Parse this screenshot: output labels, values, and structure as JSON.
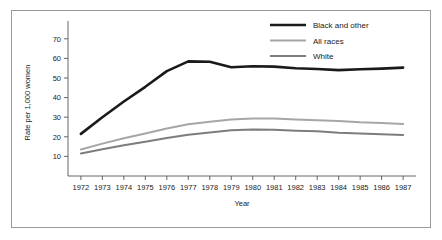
{
  "chart_data": {
    "type": "line",
    "title": "",
    "xlabel": "Year",
    "ylabel": "Rate per 1,000 women",
    "x": [
      1972,
      1973,
      1974,
      1975,
      1976,
      1977,
      1978,
      1979,
      1980,
      1981,
      1982,
      1983,
      1984,
      1985,
      1986,
      1987
    ],
    "xtick_labels": [
      "1972",
      "1973",
      "1974",
      "1975",
      "1976",
      "1977",
      "1978",
      "1979",
      "1980",
      "1981",
      "1982",
      "1983",
      "1984",
      "1985",
      "1986",
      "1987"
    ],
    "ytick_labels": [
      "10",
      "20",
      "30",
      "40",
      "50",
      "60",
      "70"
    ],
    "yticks": [
      10,
      20,
      30,
      40,
      50,
      60,
      70
    ],
    "xlim": [
      1971.4,
      1987.6
    ],
    "ylim": [
      0,
      75
    ],
    "grid": false,
    "legend_position": "top-right",
    "series": [
      {
        "name": "Black and other",
        "color": "#1a1a1a",
        "width": 2.6,
        "values": [
          21.5,
          30.0,
          38.0,
          45.5,
          53.5,
          58.5,
          58.3,
          55.5,
          56.0,
          55.8,
          55.0,
          54.6,
          54.0,
          54.5,
          54.8,
          55.3
        ]
      },
      {
        "name": "All races",
        "color": "#a6a6a6",
        "width": 2.0,
        "values": [
          13.5,
          16.5,
          19.3,
          21.7,
          24.2,
          26.4,
          27.7,
          28.8,
          29.3,
          29.3,
          28.8,
          28.5,
          28.1,
          27.4,
          27.0,
          26.5
        ]
      },
      {
        "name": "White",
        "color": "#7d7d7d",
        "width": 2.0,
        "values": [
          11.5,
          13.6,
          15.7,
          17.5,
          19.4,
          21.0,
          22.2,
          23.3,
          23.7,
          23.6,
          23.1,
          22.8,
          22.1,
          21.7,
          21.3,
          20.9
        ]
      }
    ]
  },
  "figure": {
    "border_color": "#9a9a9a",
    "background": "#ffffff"
  }
}
